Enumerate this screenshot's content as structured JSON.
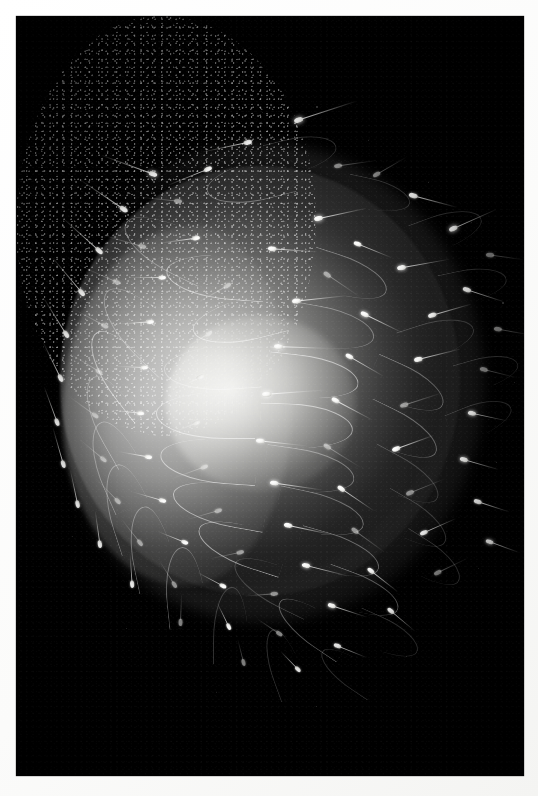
{
  "image": {
    "kind": "photograph",
    "subject": "sperm-cells-surrounding-ovum",
    "medium": "dark-field light micrograph",
    "orientation": "portrait",
    "width_px": 538,
    "height_px": 796,
    "border": {
      "style": "white photographic print border",
      "color": "#ffffff",
      "thickness_px": 16
    },
    "background_color": "#000000",
    "subject_color": "#ffffff",
    "midtone_color": "#8a8a88",
    "has_text": false,
    "has_ui_controls": false,
    "caption": ""
  },
  "frame": {
    "left": 16,
    "top": 16,
    "width": 508,
    "height": 760
  },
  "scene": {
    "ovum": {
      "label": "ovum",
      "center_x": 244,
      "center_y": 365,
      "width": 400,
      "height": 430,
      "bright_core_x": 245,
      "bright_core_y": 387
    },
    "corona": {
      "label": "corona of sperm tails",
      "center_x": 248,
      "center_y": 367,
      "width": 440,
      "height": 478
    },
    "thicket": {
      "label": "dense tail thicket",
      "left": 46,
      "top": 210,
      "width": 230,
      "height": 360
    },
    "sperm_count_visible": 86
  },
  "sperm": [
    {
      "x": 278,
      "y": 105,
      "r": -18,
      "len": 54,
      "s": 1.05,
      "cls": "bright"
    },
    {
      "x": 236,
      "y": 126,
      "r": 168,
      "len": 46,
      "s": 0.95,
      "cls": ""
    },
    {
      "x": 318,
      "y": 150,
      "r": -8,
      "len": 40,
      "s": 0.9,
      "cls": "dim"
    },
    {
      "x": 141,
      "y": 160,
      "r": 200,
      "len": 52,
      "s": 1.0,
      "cls": "bright"
    },
    {
      "x": 196,
      "y": 152,
      "r": 158,
      "len": 44,
      "s": 0.92,
      "cls": ""
    },
    {
      "x": 357,
      "y": 160,
      "r": -30,
      "len": 36,
      "s": 0.88,
      "cls": "dim"
    },
    {
      "x": 393,
      "y": 178,
      "r": 15,
      "len": 42,
      "s": 1.0,
      "cls": ""
    },
    {
      "x": 111,
      "y": 196,
      "r": 214,
      "len": 50,
      "s": 0.98,
      "cls": ""
    },
    {
      "x": 166,
      "y": 186,
      "r": 186,
      "len": 40,
      "s": 0.9,
      "cls": "dim"
    },
    {
      "x": 298,
      "y": 203,
      "r": -12,
      "len": 46,
      "s": 1.0,
      "cls": "bright"
    },
    {
      "x": 338,
      "y": 226,
      "r": 22,
      "len": 38,
      "s": 0.9,
      "cls": ""
    },
    {
      "x": 433,
      "y": 214,
      "r": -24,
      "len": 44,
      "s": 1.0,
      "cls": "bright"
    },
    {
      "x": 470,
      "y": 238,
      "r": 8,
      "len": 34,
      "s": 0.92,
      "cls": "dim"
    },
    {
      "x": 86,
      "y": 238,
      "r": 222,
      "len": 48,
      "s": 0.96,
      "cls": ""
    },
    {
      "x": 130,
      "y": 232,
      "r": 196,
      "len": 42,
      "s": 0.9,
      "cls": "dim"
    },
    {
      "x": 184,
      "y": 222,
      "r": 172,
      "len": 38,
      "s": 0.88,
      "cls": ""
    },
    {
      "x": 252,
      "y": 232,
      "r": 4,
      "len": 44,
      "s": 0.95,
      "cls": ""
    },
    {
      "x": 308,
      "y": 256,
      "r": 34,
      "len": 40,
      "s": 0.92,
      "cls": "dim"
    },
    {
      "x": 381,
      "y": 252,
      "r": -10,
      "len": 46,
      "s": 1.0,
      "cls": "bright"
    },
    {
      "x": 447,
      "y": 272,
      "r": 18,
      "len": 38,
      "s": 0.95,
      "cls": ""
    },
    {
      "x": 68,
      "y": 280,
      "r": 230,
      "len": 46,
      "s": 0.94,
      "cls": ""
    },
    {
      "x": 104,
      "y": 268,
      "r": 204,
      "len": 40,
      "s": 0.9,
      "cls": "dim"
    },
    {
      "x": 150,
      "y": 262,
      "r": 180,
      "len": 36,
      "s": 0.86,
      "cls": ""
    },
    {
      "x": 215,
      "y": 268,
      "r": 150,
      "len": 42,
      "s": 0.9,
      "cls": "dim"
    },
    {
      "x": 276,
      "y": 285,
      "r": -6,
      "len": 48,
      "s": 1.0,
      "cls": ""
    },
    {
      "x": 345,
      "y": 296,
      "r": 26,
      "len": 42,
      "s": 0.95,
      "cls": "bright"
    },
    {
      "x": 412,
      "y": 300,
      "r": -16,
      "len": 40,
      "s": 0.95,
      "cls": ""
    },
    {
      "x": 478,
      "y": 312,
      "r": 10,
      "len": 34,
      "s": 0.9,
      "cls": "dim"
    },
    {
      "x": 52,
      "y": 322,
      "r": 238,
      "len": 44,
      "s": 0.92,
      "cls": ""
    },
    {
      "x": 92,
      "y": 312,
      "r": 208,
      "len": 38,
      "s": 0.88,
      "cls": "dim"
    },
    {
      "x": 138,
      "y": 306,
      "r": 176,
      "len": 36,
      "s": 0.86,
      "cls": ""
    },
    {
      "x": 196,
      "y": 316,
      "r": 148,
      "len": 40,
      "s": 0.9,
      "cls": "dim"
    },
    {
      "x": 258,
      "y": 330,
      "r": 2,
      "len": 50,
      "s": 1.02,
      "cls": "bright"
    },
    {
      "x": 330,
      "y": 338,
      "r": 30,
      "len": 40,
      "s": 0.92,
      "cls": ""
    },
    {
      "x": 398,
      "y": 344,
      "r": -14,
      "len": 42,
      "s": 0.96,
      "cls": ""
    },
    {
      "x": 464,
      "y": 352,
      "r": 14,
      "len": 34,
      "s": 0.9,
      "cls": "dim"
    },
    {
      "x": 46,
      "y": 366,
      "r": 244,
      "len": 42,
      "s": 0.9,
      "cls": ""
    },
    {
      "x": 86,
      "y": 358,
      "r": 212,
      "len": 36,
      "s": 0.86,
      "cls": "dim"
    },
    {
      "x": 132,
      "y": 352,
      "r": 182,
      "len": 34,
      "s": 0.84,
      "cls": ""
    },
    {
      "x": 188,
      "y": 360,
      "r": 154,
      "len": 38,
      "s": 0.88,
      "cls": "dim"
    },
    {
      "x": 246,
      "y": 378,
      "r": -4,
      "len": 54,
      "s": 1.05,
      "cls": "bright"
    },
    {
      "x": 316,
      "y": 382,
      "r": 28,
      "len": 42,
      "s": 0.94,
      "cls": ""
    },
    {
      "x": 384,
      "y": 390,
      "r": -18,
      "len": 40,
      "s": 0.94,
      "cls": "dim"
    },
    {
      "x": 452,
      "y": 396,
      "r": 12,
      "len": 36,
      "s": 0.92,
      "cls": "bright"
    },
    {
      "x": 42,
      "y": 410,
      "r": 250,
      "len": 40,
      "s": 0.88,
      "cls": ""
    },
    {
      "x": 82,
      "y": 402,
      "r": 216,
      "len": 36,
      "s": 0.86,
      "cls": "dim"
    },
    {
      "x": 128,
      "y": 398,
      "r": 186,
      "len": 34,
      "s": 0.84,
      "cls": ""
    },
    {
      "x": 184,
      "y": 406,
      "r": 158,
      "len": 38,
      "s": 0.88,
      "cls": "dim"
    },
    {
      "x": 240,
      "y": 424,
      "r": 6,
      "len": 46,
      "s": 0.98,
      "cls": ""
    },
    {
      "x": 308,
      "y": 428,
      "r": 32,
      "len": 40,
      "s": 0.92,
      "cls": "dim"
    },
    {
      "x": 376,
      "y": 434,
      "r": -20,
      "len": 40,
      "s": 0.94,
      "cls": ""
    },
    {
      "x": 444,
      "y": 442,
      "r": 16,
      "len": 36,
      "s": 0.92,
      "cls": "bright"
    },
    {
      "x": 48,
      "y": 452,
      "r": 254,
      "len": 40,
      "s": 0.88,
      "cls": ""
    },
    {
      "x": 90,
      "y": 446,
      "r": 220,
      "len": 34,
      "s": 0.84,
      "cls": "dim"
    },
    {
      "x": 136,
      "y": 442,
      "r": 190,
      "len": 34,
      "s": 0.84,
      "cls": ""
    },
    {
      "x": 192,
      "y": 450,
      "r": 160,
      "len": 38,
      "s": 0.88,
      "cls": "dim"
    },
    {
      "x": 254,
      "y": 466,
      "r": 8,
      "len": 46,
      "s": 0.98,
      "cls": "bright"
    },
    {
      "x": 322,
      "y": 470,
      "r": 34,
      "len": 40,
      "s": 0.92,
      "cls": ""
    },
    {
      "x": 390,
      "y": 478,
      "r": -22,
      "len": 38,
      "s": 0.92,
      "cls": "dim"
    },
    {
      "x": 458,
      "y": 484,
      "r": 18,
      "len": 34,
      "s": 0.9,
      "cls": ""
    },
    {
      "x": 62,
      "y": 492,
      "r": 258,
      "len": 38,
      "s": 0.86,
      "cls": ""
    },
    {
      "x": 104,
      "y": 488,
      "r": 226,
      "len": 34,
      "s": 0.84,
      "cls": "dim"
    },
    {
      "x": 150,
      "y": 486,
      "r": 196,
      "len": 34,
      "s": 0.84,
      "cls": ""
    },
    {
      "x": 206,
      "y": 494,
      "r": 164,
      "len": 36,
      "s": 0.86,
      "cls": "dim"
    },
    {
      "x": 268,
      "y": 508,
      "r": 12,
      "len": 44,
      "s": 0.96,
      "cls": ""
    },
    {
      "x": 336,
      "y": 512,
      "r": 36,
      "len": 38,
      "s": 0.9,
      "cls": "dim"
    },
    {
      "x": 404,
      "y": 518,
      "r": -24,
      "len": 36,
      "s": 0.9,
      "cls": ""
    },
    {
      "x": 470,
      "y": 524,
      "r": 20,
      "len": 32,
      "s": 0.88,
      "cls": "bright"
    },
    {
      "x": 84,
      "y": 532,
      "r": 262,
      "len": 36,
      "s": 0.86,
      "cls": ""
    },
    {
      "x": 126,
      "y": 530,
      "r": 232,
      "len": 34,
      "s": 0.84,
      "cls": "dim"
    },
    {
      "x": 172,
      "y": 528,
      "r": 202,
      "len": 32,
      "s": 0.82,
      "cls": ""
    },
    {
      "x": 228,
      "y": 536,
      "r": 168,
      "len": 34,
      "s": 0.84,
      "cls": "dim"
    },
    {
      "x": 286,
      "y": 548,
      "r": 14,
      "len": 42,
      "s": 0.94,
      "cls": "bright"
    },
    {
      "x": 352,
      "y": 552,
      "r": 38,
      "len": 36,
      "s": 0.88,
      "cls": ""
    },
    {
      "x": 418,
      "y": 558,
      "r": -26,
      "len": 34,
      "s": 0.88,
      "cls": "dim"
    },
    {
      "x": 116,
      "y": 572,
      "r": 266,
      "len": 34,
      "s": 0.84,
      "cls": ""
    },
    {
      "x": 160,
      "y": 572,
      "r": 238,
      "len": 32,
      "s": 0.82,
      "cls": "dim"
    },
    {
      "x": 210,
      "y": 572,
      "r": 208,
      "len": 32,
      "s": 0.82,
      "cls": ""
    },
    {
      "x": 262,
      "y": 578,
      "r": 176,
      "len": 32,
      "s": 0.84,
      "cls": "dim"
    },
    {
      "x": 312,
      "y": 588,
      "r": 18,
      "len": 38,
      "s": 0.9,
      "cls": "bright"
    },
    {
      "x": 372,
      "y": 592,
      "r": 40,
      "len": 34,
      "s": 0.86,
      "cls": ""
    },
    {
      "x": 164,
      "y": 610,
      "r": 272,
      "len": 32,
      "s": 0.82,
      "cls": "dim"
    },
    {
      "x": 214,
      "y": 614,
      "r": 244,
      "len": 30,
      "s": 0.8,
      "cls": ""
    },
    {
      "x": 266,
      "y": 620,
      "r": 214,
      "len": 30,
      "s": 0.8,
      "cls": "dim"
    },
    {
      "x": 318,
      "y": 628,
      "r": 22,
      "len": 34,
      "s": 0.86,
      "cls": ""
    },
    {
      "x": 228,
      "y": 650,
      "r": 256,
      "len": 28,
      "s": 0.78,
      "cls": "dim"
    },
    {
      "x": 284,
      "y": 656,
      "r": 226,
      "len": 28,
      "s": 0.78,
      "cls": ""
    }
  ],
  "filaments": [
    {
      "x": 250,
      "y": 120,
      "w": 70,
      "h": 34,
      "r": -14,
      "cls": "f-soft"
    },
    {
      "x": 190,
      "y": 146,
      "w": 86,
      "h": 40,
      "r": 166,
      "cls": ""
    },
    {
      "x": 330,
      "y": 164,
      "w": 64,
      "h": 30,
      "r": 12,
      "cls": "f-soft"
    },
    {
      "x": 104,
      "y": 206,
      "w": 92,
      "h": 46,
      "r": 206,
      "cls": ""
    },
    {
      "x": 396,
      "y": 196,
      "w": 70,
      "h": 34,
      "r": -20,
      "cls": "f-soft"
    },
    {
      "x": 150,
      "y": 238,
      "w": 98,
      "h": 44,
      "r": 184,
      "cls": "f-hot"
    },
    {
      "x": 292,
      "y": 242,
      "w": 80,
      "h": 38,
      "r": 18,
      "cls": ""
    },
    {
      "x": 424,
      "y": 252,
      "w": 66,
      "h": 32,
      "r": -12,
      "cls": "f-soft"
    },
    {
      "x": 76,
      "y": 286,
      "w": 96,
      "h": 48,
      "r": 224,
      "cls": ""
    },
    {
      "x": 176,
      "y": 284,
      "w": 92,
      "h": 42,
      "r": 166,
      "cls": "f-hot"
    },
    {
      "x": 272,
      "y": 292,
      "w": 86,
      "h": 40,
      "r": 10,
      "cls": ""
    },
    {
      "x": 384,
      "y": 304,
      "w": 74,
      "h": 36,
      "r": -18,
      "cls": "f-soft"
    },
    {
      "x": 60,
      "y": 332,
      "w": 94,
      "h": 46,
      "r": 232,
      "cls": "f-hot"
    },
    {
      "x": 148,
      "y": 330,
      "w": 96,
      "h": 44,
      "r": 176,
      "cls": ""
    },
    {
      "x": 252,
      "y": 340,
      "w": 90,
      "h": 42,
      "r": 6,
      "cls": "f-hot"
    },
    {
      "x": 352,
      "y": 352,
      "w": 78,
      "h": 38,
      "r": 24,
      "cls": ""
    },
    {
      "x": 440,
      "y": 340,
      "w": 62,
      "h": 30,
      "r": -16,
      "cls": "f-soft"
    },
    {
      "x": 52,
      "y": 380,
      "w": 92,
      "h": 44,
      "r": 240,
      "cls": ""
    },
    {
      "x": 140,
      "y": 376,
      "w": 98,
      "h": 46,
      "r": 180,
      "cls": "f-hot"
    },
    {
      "x": 244,
      "y": 388,
      "w": 92,
      "h": 44,
      "r": 2,
      "cls": "f-hot"
    },
    {
      "x": 344,
      "y": 398,
      "w": 80,
      "h": 38,
      "r": 26,
      "cls": ""
    },
    {
      "x": 432,
      "y": 386,
      "w": 64,
      "h": 32,
      "r": -22,
      "cls": "f-soft"
    },
    {
      "x": 56,
      "y": 426,
      "w": 90,
      "h": 44,
      "r": 246,
      "cls": ""
    },
    {
      "x": 144,
      "y": 422,
      "w": 96,
      "h": 44,
      "r": 184,
      "cls": "f-hot"
    },
    {
      "x": 248,
      "y": 434,
      "w": 90,
      "h": 42,
      "r": 8,
      "cls": ""
    },
    {
      "x": 348,
      "y": 444,
      "w": 78,
      "h": 36,
      "r": 28,
      "cls": "f-soft"
    },
    {
      "x": 68,
      "y": 470,
      "w": 88,
      "h": 42,
      "r": 252,
      "cls": ""
    },
    {
      "x": 156,
      "y": 466,
      "w": 94,
      "h": 42,
      "r": 190,
      "cls": "f-hot"
    },
    {
      "x": 260,
      "y": 478,
      "w": 88,
      "h": 40,
      "r": 12,
      "cls": ""
    },
    {
      "x": 360,
      "y": 488,
      "w": 74,
      "h": 36,
      "r": 30,
      "cls": "f-soft"
    },
    {
      "x": 92,
      "y": 512,
      "w": 84,
      "h": 40,
      "r": 258,
      "cls": ""
    },
    {
      "x": 180,
      "y": 508,
      "w": 90,
      "h": 40,
      "r": 198,
      "cls": "f-hot"
    },
    {
      "x": 280,
      "y": 520,
      "w": 84,
      "h": 38,
      "r": 16,
      "cls": ""
    },
    {
      "x": 378,
      "y": 528,
      "w": 70,
      "h": 34,
      "r": 32,
      "cls": "f-soft"
    },
    {
      "x": 128,
      "y": 552,
      "w": 80,
      "h": 38,
      "r": 264,
      "cls": ""
    },
    {
      "x": 214,
      "y": 548,
      "w": 86,
      "h": 38,
      "r": 206,
      "cls": "f-soft"
    },
    {
      "x": 306,
      "y": 560,
      "w": 78,
      "h": 36,
      "r": 20,
      "cls": ""
    },
    {
      "x": 176,
      "y": 592,
      "w": 76,
      "h": 34,
      "r": 270,
      "cls": "f-soft"
    },
    {
      "x": 256,
      "y": 592,
      "w": 80,
      "h": 34,
      "r": 214,
      "cls": ""
    },
    {
      "x": 336,
      "y": 604,
      "w": 68,
      "h": 32,
      "r": 24,
      "cls": "f-soft"
    },
    {
      "x": 232,
      "y": 632,
      "w": 70,
      "h": 30,
      "r": 250,
      "cls": "f-soft"
    },
    {
      "x": 300,
      "y": 640,
      "w": 64,
      "h": 28,
      "r": 214,
      "cls": "f-soft"
    }
  ],
  "dust": [
    {
      "x": 300,
      "y": 90,
      "d": 1.5,
      "o": 0.5
    },
    {
      "x": 352,
      "y": 124,
      "d": 1.2,
      "o": 0.4
    },
    {
      "x": 412,
      "y": 166,
      "d": 1.4,
      "o": 0.45
    },
    {
      "x": 455,
      "y": 206,
      "d": 1.2,
      "o": 0.35
    },
    {
      "x": 486,
      "y": 286,
      "d": 1.5,
      "o": 0.5
    },
    {
      "x": 498,
      "y": 366,
      "d": 1.3,
      "o": 0.4
    },
    {
      "x": 480,
      "y": 446,
      "d": 1.4,
      "o": 0.45
    },
    {
      "x": 462,
      "y": 552,
      "d": 1.2,
      "o": 0.35
    },
    {
      "x": 390,
      "y": 640,
      "d": 1.3,
      "o": 0.4
    },
    {
      "x": 300,
      "y": 690,
      "d": 1.4,
      "o": 0.45
    },
    {
      "x": 200,
      "y": 676,
      "d": 1.2,
      "o": 0.35
    },
    {
      "x": 110,
      "y": 612,
      "d": 1.3,
      "o": 0.4
    },
    {
      "x": 56,
      "y": 520,
      "d": 1.2,
      "o": 0.35
    },
    {
      "x": 36,
      "y": 430,
      "d": 1.4,
      "o": 0.45
    },
    {
      "x": 44,
      "y": 320,
      "d": 1.2,
      "o": 0.35
    },
    {
      "x": 96,
      "y": 214,
      "d": 1.3,
      "o": 0.4
    },
    {
      "x": 176,
      "y": 142,
      "d": 1.2,
      "o": 0.35
    },
    {
      "x": 246,
      "y": 96,
      "d": 1.1,
      "o": 0.3
    }
  ]
}
